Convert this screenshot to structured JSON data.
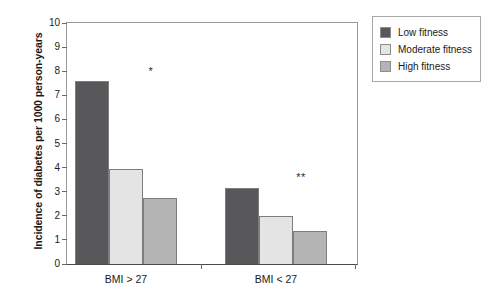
{
  "chart_data": {
    "type": "bar",
    "title": "",
    "subtitle": "",
    "xlabel": "",
    "ylabel": "Incidence of diabetes per 1000 person-years",
    "categories": [
      "BMI > 27",
      "BMI < 27"
    ],
    "series": [
      {
        "name": "Low fitness",
        "values": [
          7.6,
          3.15
        ],
        "color": "#58585a"
      },
      {
        "name": "Moderate fitness",
        "values": [
          3.95,
          1.98
        ],
        "color": "#e4e4e4"
      },
      {
        "name": "High fitness",
        "values": [
          2.75,
          1.35
        ],
        "color": "#b4b4b4"
      }
    ],
    "ylim": [
      0,
      10
    ],
    "yticks": [
      10,
      9,
      8,
      7,
      6,
      5,
      4,
      3,
      2,
      1,
      0
    ],
    "ytick_labels": [
      "10",
      "9",
      "8",
      "7",
      "6",
      "5",
      "4",
      "3",
      "2",
      "1",
      "0"
    ],
    "grid": false,
    "legend_position": "right-top",
    "annotations": [
      {
        "text": "*",
        "group": "BMI > 27",
        "value": 8.2
      },
      {
        "text": "**",
        "group": "BMI < 27",
        "value": 3.8
      }
    ]
  },
  "legend": {
    "items": [
      {
        "label": "Low fitness",
        "color": "#58585a"
      },
      {
        "label": "Moderate fitness",
        "color": "#e4e4e4"
      },
      {
        "label": "High fitness",
        "color": "#b4b4b4"
      }
    ]
  },
  "axis": {
    "y_title": "Incidence of diabetes per 1000 person-years",
    "y_ticks": [
      "10",
      "9",
      "8",
      "7",
      "6",
      "5",
      "4",
      "3",
      "2",
      "1",
      "0"
    ],
    "x_groups": [
      "BMI > 27",
      "BMI < 27"
    ]
  },
  "annotations": {
    "group1_mark": "*",
    "group2_mark": "**"
  }
}
